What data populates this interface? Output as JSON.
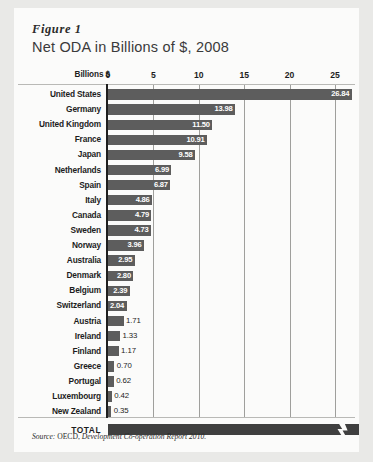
{
  "figure": {
    "label": "Figure 1",
    "title": "Net ODA in Billions of $, 2008"
  },
  "axis": {
    "unit_label": "Billions $",
    "ticks": [
      0,
      5,
      10,
      15,
      20,
      25
    ],
    "tick_labels": [
      "0",
      "5",
      "10",
      "15",
      "20",
      "25"
    ],
    "min": 0,
    "max": 26.84
  },
  "total": {
    "label": "TOTAL",
    "broken_axis": true
  },
  "source": {
    "prefix": "Source:",
    "org": " OECD, ",
    "title": "Development Co-operation Report 2010."
  },
  "colors": {
    "bar": "#5d5d5d",
    "total_bar": "#3f3f3f",
    "card": "#fbfbfa",
    "page": "#e9e9e7",
    "axis": "#1f1f1f",
    "grid": "#9f9f9c",
    "text": "#1d1d1d",
    "value_in_bar": "#ffffff"
  },
  "chart_data": {
    "type": "bar",
    "orientation": "horizontal",
    "title": "Net ODA in Billions of $, 2008",
    "xlabel": "Billions $",
    "ylabel": "",
    "xlim": [
      0,
      25
    ],
    "grid": true,
    "legend": "none",
    "xticks": [
      0,
      5,
      10,
      15,
      20,
      25
    ],
    "categories": [
      "United States",
      "Germany",
      "United Kingdom",
      "France",
      "Japan",
      "Netherlands",
      "Spain",
      "Italy",
      "Canada",
      "Sweden",
      "Norway",
      "Australia",
      "Denmark",
      "Belgium",
      "Switzerland",
      "Austria",
      "Ireland",
      "Finland",
      "Greece",
      "Portugal",
      "Luxembourg",
      "New Zealand"
    ],
    "values": [
      26.84,
      13.98,
      11.5,
      10.91,
      9.58,
      6.99,
      6.87,
      4.86,
      4.79,
      4.73,
      3.96,
      2.95,
      2.8,
      2.39,
      2.04,
      1.71,
      1.33,
      1.17,
      0.7,
      0.62,
      0.42,
      0.35
    ],
    "value_labels": [
      "26.84",
      "13.98",
      "11.50",
      "10.91",
      "9.58",
      "6.99",
      "6.87",
      "4.86",
      "4.79",
      "4.73",
      "3.96",
      "2.95",
      "2.80",
      "2.39",
      "2.04",
      "1.71",
      "1.33",
      "1.17",
      "0.70",
      "0.62",
      "0.42",
      "0.35"
    ],
    "total_label": "TOTAL",
    "annotations": [
      "TOTAL bar extends beyond axis with a break symbol"
    ]
  }
}
